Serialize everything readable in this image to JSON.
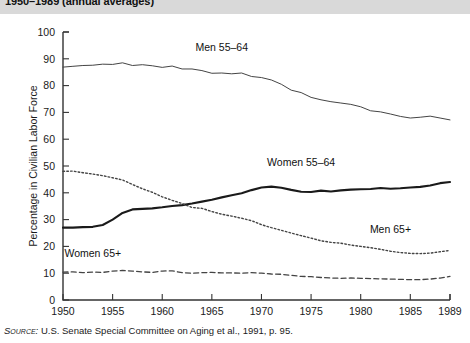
{
  "figure": {
    "title": "1950–1989 (annual averages)",
    "source_word": "Source:",
    "source_text": " U.S. Senate Special Committee on Aging et al., 1991, p. 95."
  },
  "chart_data": {
    "type": "line",
    "title": "1950–1989 (annual averages)",
    "xlabel": "",
    "ylabel": "Percentage in Civilian Labor Force",
    "xlim": [
      1950,
      1989
    ],
    "ylim": [
      0,
      100
    ],
    "grid": false,
    "legend": "inline-annotations",
    "xticks": [
      1950,
      1955,
      1960,
      1965,
      1970,
      1975,
      1980,
      1985,
      1989
    ],
    "xtick_labels": [
      "1950",
      "1955",
      "1960",
      "1965",
      "1970",
      "1975",
      "1980",
      "1985",
      "1989"
    ],
    "yticks": [
      0,
      10,
      20,
      30,
      40,
      50,
      60,
      70,
      80,
      90,
      100
    ],
    "ytick_labels": [
      "0",
      "10",
      "20",
      "30",
      "40",
      "50",
      "60",
      "70",
      "80",
      "90",
      "100"
    ],
    "x": [
      1950,
      1951,
      1952,
      1953,
      1954,
      1955,
      1956,
      1957,
      1958,
      1959,
      1960,
      1961,
      1962,
      1963,
      1964,
      1965,
      1966,
      1967,
      1968,
      1969,
      1970,
      1971,
      1972,
      1973,
      1974,
      1975,
      1976,
      1977,
      1978,
      1979,
      1980,
      1981,
      1982,
      1983,
      1984,
      1985,
      1986,
      1987,
      1988,
      1989
    ],
    "series": [
      {
        "name": "Men 55–64",
        "style": "solid-thin",
        "label": "Men 55–64",
        "values": [
          86.9,
          87.2,
          87.5,
          87.6,
          88.0,
          87.9,
          88.5,
          87.5,
          87.8,
          87.4,
          86.8,
          87.3,
          86.2,
          86.2,
          85.6,
          84.6,
          84.7,
          84.4,
          84.7,
          83.4,
          83.0,
          82.1,
          80.5,
          78.3,
          77.4,
          75.6,
          74.7,
          74.0,
          73.5,
          73.0,
          72.1,
          70.6,
          70.2,
          69.4,
          68.5,
          67.9,
          68.2,
          68.6,
          67.9,
          67.2
        ]
      },
      {
        "name": "Women 55–64",
        "style": "solid-thick",
        "label": "Women 55–64",
        "values": [
          27.0,
          27.0,
          27.2,
          27.3,
          28.0,
          30.0,
          32.5,
          33.8,
          34.0,
          34.2,
          34.6,
          35.1,
          35.4,
          36.0,
          36.7,
          37.4,
          38.3,
          39.1,
          39.8,
          41.0,
          42.0,
          42.3,
          41.9,
          41.1,
          40.4,
          40.3,
          40.8,
          40.5,
          40.9,
          41.2,
          41.3,
          41.4,
          41.8,
          41.5,
          41.7,
          42.0,
          42.2,
          42.7,
          43.6,
          44.0
        ]
      },
      {
        "name": "Men 65+",
        "style": "dotted",
        "label": "Men 65+",
        "values": [
          48.0,
          48.1,
          47.5,
          47.0,
          46.4,
          45.6,
          44.8,
          43.1,
          41.5,
          40.2,
          38.5,
          37.2,
          36.0,
          34.5,
          34.2,
          33.0,
          32.0,
          31.3,
          30.5,
          29.6,
          28.1,
          27.0,
          26.0,
          25.0,
          24.0,
          23.1,
          22.1,
          21.5,
          21.2,
          20.5,
          20.0,
          19.5,
          18.9,
          18.2,
          17.7,
          17.4,
          17.3,
          17.5,
          18.0,
          18.5
        ]
      },
      {
        "name": "Women 65+",
        "style": "dashed",
        "label": "Women 65+",
        "values": [
          10.4,
          10.5,
          10.2,
          10.4,
          10.3,
          10.8,
          11.0,
          10.8,
          10.5,
          10.3,
          10.8,
          10.9,
          10.2,
          10.0,
          10.2,
          10.3,
          10.1,
          10.1,
          10.0,
          10.2,
          10.0,
          9.7,
          9.6,
          9.2,
          8.8,
          8.7,
          8.4,
          8.2,
          8.1,
          8.2,
          8.1,
          8.0,
          7.9,
          7.8,
          7.7,
          7.6,
          7.6,
          7.8,
          8.2,
          8.8
        ]
      }
    ],
    "annotations": [
      {
        "text": "Men 55–64",
        "x": 1966,
        "y": 93
      },
      {
        "text": "Women 55–64",
        "x": 1974,
        "y": 50
      },
      {
        "text": "Men 65+",
        "x": 1983,
        "y": 25
      },
      {
        "text": "Women 65+",
        "x": 1953,
        "y": 16
      }
    ]
  }
}
